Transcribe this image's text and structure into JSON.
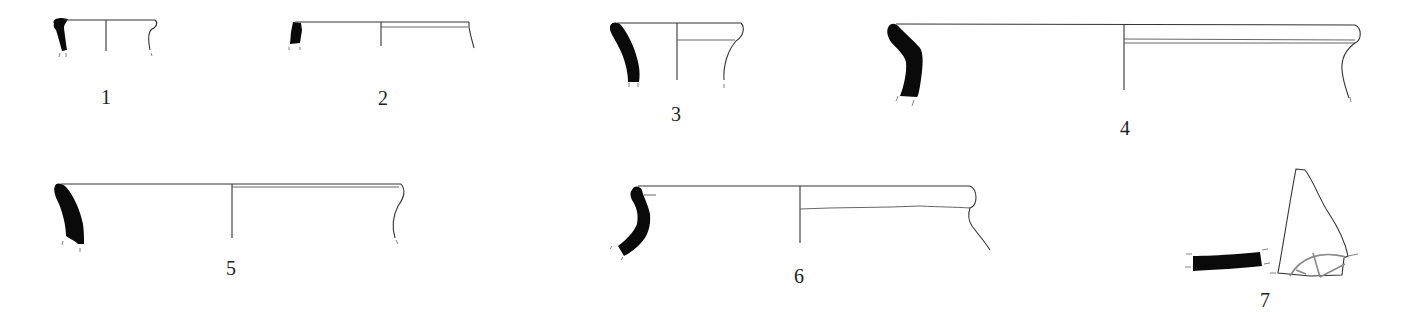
{
  "figure": {
    "type": "pottery rim profile drawings",
    "colors": {
      "section_fill": "#0a0a0a",
      "line": "#333333",
      "background": "#ffffff"
    },
    "items": [
      {
        "number": "1",
        "label_pos": [
          106,
          85
        ]
      },
      {
        "number": "2",
        "label_pos": [
          383,
          86
        ]
      },
      {
        "number": "3",
        "label_pos": [
          676,
          123
        ]
      },
      {
        "number": "4",
        "label_pos": [
          1125,
          136
        ]
      },
      {
        "number": "5",
        "label_pos": [
          231,
          275
        ]
      },
      {
        "number": "6",
        "label_pos": [
          799,
          285
        ]
      },
      {
        "number": "7",
        "label_pos": [
          1265,
          308
        ]
      }
    ]
  }
}
